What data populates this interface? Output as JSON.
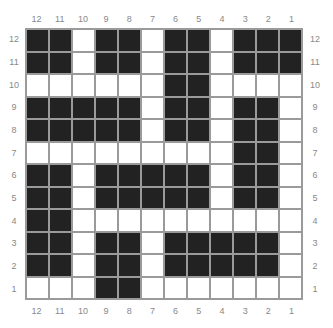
{
  "chart_data": {
    "type": "heatmap",
    "title": "",
    "column_labels": [
      "12",
      "11",
      "10",
      "9",
      "8",
      "7",
      "6",
      "5",
      "4",
      "3",
      "2",
      "1"
    ],
    "row_labels": [
      "12",
      "11",
      "10",
      "9",
      "8",
      "7",
      "6",
      "5",
      "4",
      "3",
      "2",
      "1"
    ],
    "colors": {
      "filled": "#222222",
      "empty": "#ffffff",
      "grid": "#9a9a9a",
      "label": "#888888"
    },
    "rows": [
      [
        1,
        1,
        0,
        1,
        1,
        0,
        1,
        1,
        0,
        1,
        1,
        1
      ],
      [
        1,
        1,
        0,
        1,
        1,
        0,
        1,
        1,
        0,
        1,
        1,
        1
      ],
      [
        0,
        0,
        0,
        0,
        0,
        0,
        1,
        1,
        0,
        0,
        0,
        0
      ],
      [
        1,
        1,
        1,
        1,
        1,
        0,
        1,
        1,
        0,
        1,
        1,
        0
      ],
      [
        1,
        1,
        1,
        1,
        1,
        0,
        1,
        1,
        0,
        1,
        1,
        0
      ],
      [
        0,
        0,
        0,
        0,
        0,
        0,
        0,
        0,
        0,
        1,
        1,
        0
      ],
      [
        1,
        1,
        0,
        1,
        1,
        1,
        1,
        1,
        0,
        1,
        1,
        0
      ],
      [
        1,
        1,
        0,
        1,
        1,
        1,
        1,
        1,
        0,
        1,
        1,
        0
      ],
      [
        1,
        1,
        0,
        0,
        0,
        0,
        0,
        0,
        0,
        0,
        0,
        0
      ],
      [
        1,
        1,
        0,
        1,
        1,
        0,
        1,
        1,
        1,
        1,
        1,
        0
      ],
      [
        1,
        1,
        0,
        1,
        1,
        0,
        1,
        1,
        1,
        1,
        1,
        0
      ],
      [
        0,
        0,
        0,
        1,
        1,
        0,
        0,
        0,
        0,
        0,
        0,
        0
      ]
    ]
  }
}
